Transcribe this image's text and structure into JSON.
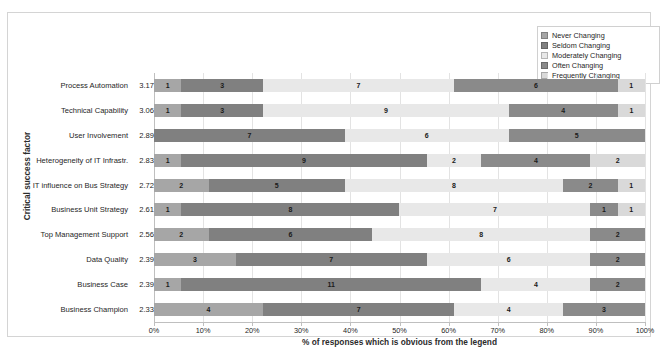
{
  "chart_data": {
    "type": "bar",
    "orientation": "horizontal",
    "stacked": true,
    "normalized_percent": true,
    "title": "",
    "xlabel": "% of responses which is obvious from the legend",
    "ylabel": "Critical success factor",
    "xlim": [
      0,
      100
    ],
    "xticks": [
      "0%",
      "10%",
      "20%",
      "30%",
      "40%",
      "50%",
      "60%",
      "70%",
      "80%",
      "90%",
      "100%"
    ],
    "xtick_values": [
      0,
      10,
      20,
      30,
      40,
      50,
      60,
      70,
      80,
      90,
      100
    ],
    "grid": true,
    "legend_position": "top-right",
    "series": [
      {
        "name": "Never Changing",
        "color": "#a6a6a6",
        "values": [
          1,
          1,
          0,
          1,
          2,
          1,
          2,
          3,
          1,
          4
        ]
      },
      {
        "name": "Seldom Changing",
        "color": "#808080",
        "values": [
          3,
          3,
          7,
          9,
          5,
          8,
          6,
          7,
          11,
          7
        ]
      },
      {
        "name": "Moderately Changing",
        "color": "#e8e8e8",
        "values": [
          7,
          9,
          6,
          2,
          8,
          7,
          8,
          6,
          4,
          4
        ]
      },
      {
        "name": "Often Changing",
        "color": "#8a8a8a",
        "values": [
          6,
          4,
          5,
          4,
          2,
          1,
          2,
          2,
          2,
          3
        ]
      },
      {
        "name": "Frequently Changing",
        "color": "#d9d9d9",
        "values": [
          1,
          1,
          0,
          2,
          1,
          1,
          0,
          0,
          0,
          0
        ]
      }
    ],
    "categories": [
      {
        "label": "Process Automation",
        "mean": "3.17"
      },
      {
        "label": "Technical Capability",
        "mean": "3.06"
      },
      {
        "label": "User Involvement",
        "mean": "2.89"
      },
      {
        "label": "Heterogeneity of IT Infrastr.",
        "mean": "2.83"
      },
      {
        "label": "IT influence on Bus Strategy",
        "mean": "2.72"
      },
      {
        "label": "Business Unit Strategy",
        "mean": "2.61"
      },
      {
        "label": "Top Management Support",
        "mean": "2.56"
      },
      {
        "label": "Data Quality",
        "mean": "2.39"
      },
      {
        "label": "Business Case",
        "mean": "2.39"
      },
      {
        "label": "Business Champion",
        "mean": "2.33"
      }
    ],
    "row_totals": [
      18,
      18,
      18,
      18,
      18,
      18,
      18,
      18,
      18,
      18
    ]
  },
  "legend": {
    "items": [
      {
        "label": "Never Changing"
      },
      {
        "label": "Seldom Changing"
      },
      {
        "label": "Moderately Changing"
      },
      {
        "label": "Often Changing"
      },
      {
        "label": "Frequently Changing"
      }
    ]
  }
}
